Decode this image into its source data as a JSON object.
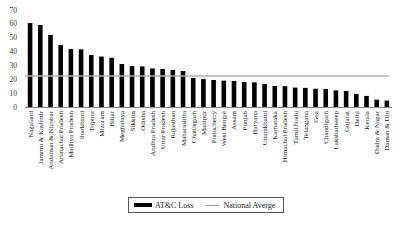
{
  "chart_data": {
    "type": "bar",
    "title": "",
    "xlabel": "",
    "ylabel": "",
    "ylim": [
      0,
      70
    ],
    "yticks": [
      0,
      10,
      20,
      30,
      40,
      50,
      60,
      70
    ],
    "grid": false,
    "legend_position": "bottom",
    "categories": [
      "Nagaland",
      "Jammu & Kashmir",
      "Andaman & Nicobar",
      "Arunachal Pradesh",
      "Madhya Pradesh",
      "Jharkhand",
      "Tripura",
      "Mizoram",
      "Bihar",
      "Meghalaya",
      "Sikkim",
      "Odisha",
      "Andhra Pradesh",
      "Uttar Pradesh",
      "Rajasthan",
      "Maharashtra",
      "Chattisgarh",
      "Manipur",
      "Puducherry",
      "West Bengal",
      "Assam",
      "Punjab",
      "Haryana",
      "Uttarakhand",
      "Karnataka",
      "Himachal Pradesh",
      "Tamil Nadu",
      "Telangana",
      "Goa",
      "Chandigarh",
      "Lakshadweep",
      "Gujarat",
      "Delhi",
      "Kerala",
      "Dadra & Nagar",
      "Daman & Diu"
    ],
    "series": [
      {
        "name": "AT&C Loss",
        "type": "bar",
        "color": "#000000",
        "values": [
          60.6,
          59.2,
          52.0,
          44.7,
          41.8,
          41.6,
          37.5,
          36.4,
          35.5,
          31.0,
          29.5,
          29.3,
          27.8,
          27.4,
          26.7,
          26.0,
          21.0,
          20.2,
          19.5,
          19.0,
          18.8,
          18.0,
          17.8,
          16.6,
          15.2,
          15.0,
          14.0,
          13.8,
          13.2,
          13.0,
          12.0,
          11.6,
          9.4,
          8.0,
          5.3,
          4.6
        ]
      },
      {
        "name": "National Averge",
        "type": "line",
        "color": "#b0b0b0",
        "value": 22.4
      }
    ]
  },
  "legend": {
    "bar_label": "AT&C Loss",
    "line_label": "National Averge"
  }
}
